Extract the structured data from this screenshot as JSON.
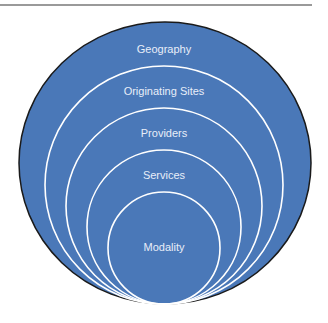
{
  "diagram": {
    "type": "nested-circles",
    "fill_color": "#4a78b8",
    "ring_color": "#ffffff",
    "outline_color": "#1a1a1a",
    "layers": [
      {
        "label": "Geography"
      },
      {
        "label": "Originating Sites"
      },
      {
        "label": "Providers"
      },
      {
        "label": "Services"
      },
      {
        "label": "Modality"
      }
    ]
  }
}
